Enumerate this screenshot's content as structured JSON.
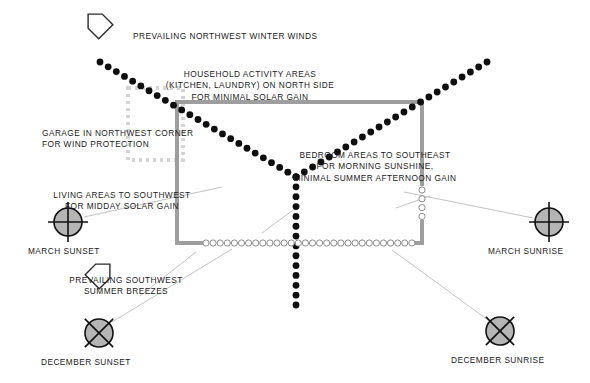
{
  "diagram": {
    "title_present": false,
    "colors": {
      "text": "#1a1a1a",
      "plan_wall": "#9a9a9a",
      "garage_dash": "#d2d2d2",
      "interior_wall_dot": "#111111",
      "window_dot_stroke": "#8c8c8c",
      "sun_fill": "#b5b5b5",
      "sun_stroke": "#111111",
      "leader_line": "#c0c0c0",
      "arrow_stroke": "#2b2b2b"
    },
    "annotations": [
      {
        "id": "prevailing-nw-winter-winds",
        "name": "prevailing-northwest-winter-winds-label",
        "lines": [
          "PREVAILING NORTHWEST WINTER WINDS"
        ],
        "x": 133,
        "y": 31,
        "align": "left"
      },
      {
        "id": "household-activity",
        "name": "household-activity-areas-label",
        "lines": [
          "HOUSEHOLD ACTIVITY AREAS",
          "(KITCHEN, LAUNDRY) ON NORTH SIDE",
          "FOR MINIMAL SOLAR GAIN"
        ],
        "x": 250,
        "y": 69,
        "align": "center"
      },
      {
        "id": "garage-nw-corner",
        "name": "garage-northwest-corner-label",
        "lines": [
          "GARAGE IN NORTHWEST CORNER",
          "FOR WIND PROTECTION"
        ],
        "x": 42,
        "y": 128,
        "align": "left"
      },
      {
        "id": "bedroom-southeast",
        "name": "bedroom-areas-southeast-label",
        "lines": [
          "BEDROOM AREAS TO SOUTHEAST",
          "FOR MORNING SUNSHINE,",
          "MINIMAL SUMMER AFTERNOON GAIN"
        ],
        "x": 375,
        "y": 150,
        "align": "center"
      },
      {
        "id": "living-southwest",
        "name": "living-areas-southwest-label",
        "lines": [
          "LIVING AREAS TO SOUTHWEST",
          "FOR MIDDAY SOLAR GAIN"
        ],
        "x": 122,
        "y": 190,
        "align": "center"
      },
      {
        "id": "prevailing-sw-summer",
        "name": "prevailing-southwest-summer-breezes-label",
        "lines": [
          "PREVAILING SOUTHWEST",
          "SUMMER BREEZES"
        ],
        "x": 126,
        "y": 275,
        "align": "center"
      }
    ],
    "sun_markers": [
      {
        "id": "march-sunset",
        "name": "march-sunset-marker",
        "label": "MARCH SUNSET",
        "cx": 68,
        "cy": 222,
        "r": 14,
        "cross": "plus",
        "label_x": 28,
        "label_y": 246
      },
      {
        "id": "march-sunrise",
        "name": "march-sunrise-marker",
        "label": "MARCH SUNRISE",
        "cx": 549,
        "cy": 222,
        "r": 14,
        "cross": "plus",
        "label_x": 488,
        "label_y": 246
      },
      {
        "id": "december-sunset",
        "name": "december-sunset-marker",
        "label": "DECEMBER SUNSET",
        "cx": 99,
        "cy": 333,
        "r": 14,
        "cross": "ex",
        "label_x": 41,
        "label_y": 357
      },
      {
        "id": "december-sunrise",
        "name": "december-sunrise-marker",
        "label": "DECEMBER SUNRISE",
        "cx": 500,
        "cy": 331,
        "r": 14,
        "cross": "ex",
        "label_x": 451,
        "label_y": 355
      }
    ],
    "wind_arrows": [
      {
        "id": "nw-winter-arrow",
        "name": "northwest-wind-arrow-icon",
        "x": 98,
        "y": 24,
        "rotate": 135
      },
      {
        "id": "sw-summer-arrow",
        "name": "southwest-wind-arrow-icon",
        "x": 100,
        "y": 274,
        "rotate": 225
      }
    ],
    "plan": {
      "name": "house-plan-outline",
      "wall_width": 4,
      "rect": {
        "x": 177,
        "y": 102,
        "w": 247,
        "h": 141
      },
      "garage": {
        "name": "garage-outline",
        "x": 128,
        "y": 88,
        "w": 55,
        "h": 72
      }
    },
    "legend_note": "Y-shaped interior partition shown as filled dots; window openings shown as hollow circles."
  }
}
